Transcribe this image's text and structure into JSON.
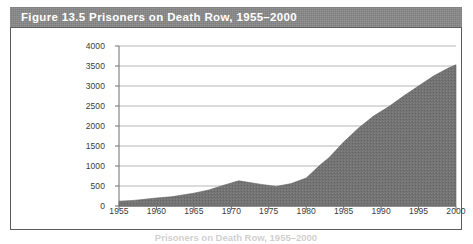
{
  "figure": {
    "title": "Figure 13.5  Prisoners on Death Row, 1955–2000",
    "caption_partial": "Prisoners on Death Row, 1955–2000",
    "title_bar_color": "#8a8a8a",
    "border_color": "#5b5b5b",
    "background_color": "#ffffff"
  },
  "chart_data": {
    "type": "area",
    "title": "Prisoners on Death Row, 1955–2000",
    "xlabel": "",
    "ylabel": "",
    "xlim": [
      1955,
      2000
    ],
    "ylim": [
      0,
      4000
    ],
    "grid": true,
    "legend": "none",
    "series_color": "#737373",
    "x_tick_labels": [
      "1955",
      "1960",
      "1965",
      "1970",
      "1975",
      "1980",
      "1985",
      "1990",
      "1995",
      "2000"
    ],
    "y_tick_labels": [
      "0",
      "500",
      "1000",
      "1500",
      "2000",
      "2500",
      "3000",
      "3500",
      "4000"
    ],
    "x_ticks": [
      1955,
      1960,
      1965,
      1970,
      1975,
      1980,
      1985,
      1990,
      1995,
      2000
    ],
    "y_ticks": [
      0,
      500,
      1000,
      1500,
      2000,
      2500,
      3000,
      3500,
      4000
    ],
    "x": [
      1955,
      1957,
      1960,
      1962,
      1965,
      1967,
      1969,
      1971,
      1972,
      1974,
      1976,
      1978,
      1980,
      1982,
      1983,
      1985,
      1987,
      1989,
      1991,
      1993,
      1995,
      1997,
      1999,
      2000
    ],
    "values": [
      120,
      140,
      200,
      230,
      320,
      400,
      520,
      630,
      600,
      540,
      490,
      560,
      700,
      1050,
      1200,
      1600,
      1950,
      2250,
      2480,
      2750,
      3000,
      3250,
      3450,
      3530
    ],
    "series": [
      {
        "name": "Prisoners on death row",
        "values": [
          120,
          140,
          200,
          230,
          320,
          400,
          520,
          630,
          600,
          540,
          490,
          560,
          700,
          1050,
          1200,
          1600,
          1950,
          2250,
          2480,
          2750,
          3000,
          3250,
          3450,
          3530
        ]
      }
    ]
  }
}
